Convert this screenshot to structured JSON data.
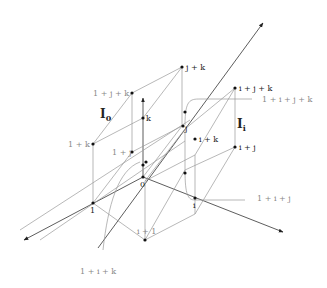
{
  "diagram": {
    "labels": {
      "origin": "0",
      "one": "1",
      "i": "i",
      "j": "j",
      "k": "k",
      "one_plus_i": "i + 1",
      "one_plus_j": "1 + j",
      "one_plus_k": "1 + k",
      "i_plus_j": "i + j",
      "i_plus_k": "i + k",
      "j_plus_k": "j + k",
      "one_plus_j_plus_k": "1 + j + k",
      "i_plus_j_plus_k": "i + j + k",
      "one_plus_i_plus_j_plus_k": "1 + i + j + k",
      "one_plus_i_plus_j": "1 + i + j",
      "one_plus_i_plus_k": "1 + i + k",
      "region_I0": "I",
      "region_I0_sub": "0",
      "region_Ii": "I",
      "region_Ii_sub": "i"
    }
  }
}
